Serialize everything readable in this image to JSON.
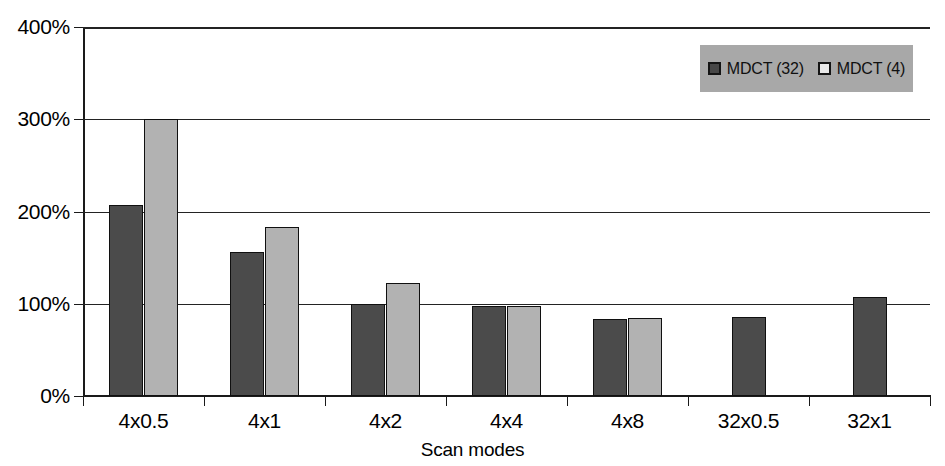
{
  "chart_data": {
    "type": "bar",
    "title": "",
    "xlabel": "Scan modes",
    "ylabel": "",
    "categories": [
      "4x0.5",
      "4x1",
      "4x2",
      "4x4",
      "4x8",
      "32x0.5",
      "32x1"
    ],
    "series": [
      {
        "name": "MDCT (32)",
        "color": "#4b4b4b",
        "values": [
          207,
          156,
          100,
          98,
          83,
          86,
          107
        ]
      },
      {
        "name": "MDCT (4)",
        "color": "#b2b2b2",
        "values": [
          300,
          183,
          122,
          98,
          85,
          null,
          null
        ]
      }
    ],
    "ytick_labels": [
      "400%",
      "300%",
      "200%",
      "100%",
      "0%"
    ],
    "ytick_values": [
      400,
      300,
      200,
      100,
      0
    ],
    "ylim": [
      0,
      400
    ],
    "grid": true,
    "legend_position": "top-right",
    "legend_background": "#a8a8a8"
  },
  "axis": {
    "x_title": "Scan modes"
  },
  "legend": {
    "entries": [
      {
        "label": "MDCT (32)"
      },
      {
        "label": "MDCT (4)"
      }
    ]
  },
  "ticks": {
    "y": [
      {
        "label": "400%"
      },
      {
        "label": "300%"
      },
      {
        "label": "200%"
      },
      {
        "label": "100%"
      },
      {
        "label": "0%"
      }
    ],
    "x": [
      {
        "label": "4x0.5"
      },
      {
        "label": "4x1"
      },
      {
        "label": "4x2"
      },
      {
        "label": "4x4"
      },
      {
        "label": "4x8"
      },
      {
        "label": "32x0.5"
      },
      {
        "label": "32x1"
      }
    ]
  }
}
